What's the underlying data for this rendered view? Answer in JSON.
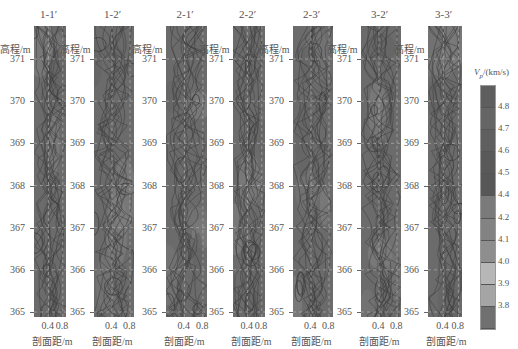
{
  "chart_data": {
    "type": "heatmap",
    "subtype": "contour",
    "title": "",
    "panels": [
      {
        "name": "1-1′"
      },
      {
        "name": "1-2′"
      },
      {
        "name": "2-1′"
      },
      {
        "name": "2-2′"
      },
      {
        "name": "2-3′"
      },
      {
        "name": "3-2′"
      },
      {
        "name": "3-3′"
      }
    ],
    "ylabel": "高程/m",
    "xlabel": "剖面距/m",
    "yticks": [
      "371",
      "370",
      "369",
      "368",
      "367",
      "366",
      "365"
    ],
    "xticks": [
      "0.4",
      "0.8"
    ],
    "ylim": [
      365,
      371.5
    ],
    "xlim": [
      0,
      0.9
    ],
    "colorbar": {
      "title": "Vp/(km/s)",
      "ticks": [
        "4.8",
        "4.7",
        "4.6",
        "4.5",
        "4.4",
        "4.2",
        "4.1",
        "4.0",
        "3.9",
        "3.8"
      ],
      "colors": [
        "#5e5e5e",
        "#656565",
        "#5f5f5f",
        "#595959",
        "#575757",
        "#7a7a7a",
        "#838383",
        "#8e8e8e",
        "#b7b7b7",
        "#a5a5a5",
        "#707070"
      ]
    },
    "grid": true
  },
  "labels": {
    "ylabel": "高程/m",
    "xlabel": "剖面距/m",
    "cbar_title": "V",
    "cbar_sub": "p",
    "cbar_unit": "/(km/s)"
  }
}
